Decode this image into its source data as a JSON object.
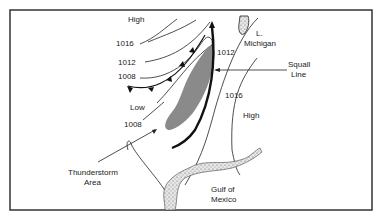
{
  "diagram": {
    "type": "weather-map",
    "labels": {
      "high_nw": "High",
      "isobar_1016_w": "1016",
      "isobar_1012_w": "1012",
      "isobar_1008_w": "1008",
      "low": "Low",
      "isobar_1008_sw": "1008",
      "lake_1": "L.",
      "lake_2": "Michigan",
      "isobar_1012_e": "1012",
      "squall_1": "Squall",
      "squall_2": "Line",
      "isobar_1016_e": "1016",
      "high_e": "High",
      "thunder_1": "Thunderstorm",
      "thunder_2": "Area",
      "gulf_1": "Gulf of",
      "gulf_2": "Mexico"
    },
    "colors": {
      "line": "#222222",
      "storm_area": "#8a8a8a",
      "border": "#333333"
    }
  }
}
